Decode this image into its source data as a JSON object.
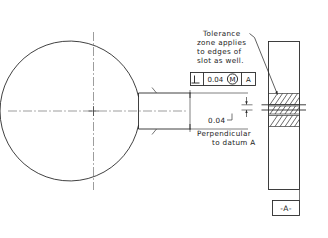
{
  "drawing": {
    "title": "Perpendicularity at MMC applied to a slot",
    "background_color": "#ffffff",
    "line_color": "#2b2b2b",
    "notes": {
      "tolerance_note": {
        "name": "tolerance-zone-note",
        "lines": [
          "Tolerance",
          "zone applies",
          "to edges of",
          "slot as well."
        ]
      },
      "perpendicular_note": {
        "name": "perpendicular-to-datum-note",
        "lines": [
          "Perpendicular",
          "to datum A"
        ]
      }
    },
    "feature_control_frame": {
      "name": "feature-control-frame",
      "geometric_characteristic_symbol": "perpendicularity",
      "tolerance_value": "0.04",
      "material_condition": "M",
      "material_condition_meaning": "MMC",
      "datum_reference": "A"
    },
    "dimensions": [
      {
        "name": "tolerance-zone-width-dimension",
        "value": "0.04",
        "type": "linear",
        "orientation": "vertical"
      }
    ],
    "datum_feature_symbol": {
      "name": "datum-feature-symbol-a",
      "label": "-A-"
    },
    "views": {
      "front_view": {
        "name": "front-view-circular-part",
        "shape": "circle",
        "feature": "slot",
        "has_centerlines": true,
        "has_center_mark": true
      },
      "side_view": {
        "name": "side-view-plate",
        "shape": "rectangle",
        "has_hatched_tolerance_zones": true,
        "hatched_zone_count": 3
      }
    }
  }
}
